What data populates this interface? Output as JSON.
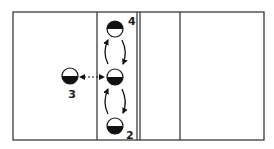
{
  "diagram": {
    "type": "volleyball-court-rotation",
    "colors": {
      "line": "#2a2a2a",
      "fill": "#111111",
      "background": "#ffffff"
    },
    "court": {
      "x": 13,
      "y": 12,
      "width": 251,
      "height": 128,
      "vertical_lines": [
        97,
        137,
        140,
        180
      ]
    },
    "players": [
      {
        "id": "center",
        "label": "",
        "cx": 115,
        "cy": 77,
        "r": 8,
        "filled_half": "bottom"
      },
      {
        "id": "p4",
        "label": "4",
        "cx": 115,
        "cy": 29,
        "r": 8,
        "filled_half": "top",
        "label_x": 131,
        "label_y": 24
      },
      {
        "id": "p3",
        "label": "3",
        "cx": 70,
        "cy": 76,
        "r": 8,
        "filled_half": "bottom",
        "label_x": 71,
        "label_y": 96
      },
      {
        "id": "p2",
        "label": "2",
        "cx": 115,
        "cy": 126,
        "r": 8,
        "filled_half": "bottom",
        "label_x": 129,
        "label_y": 139
      }
    ],
    "arrows": [
      {
        "id": "center-to-4",
        "direction": "up",
        "side": "left"
      },
      {
        "id": "4-to-center",
        "direction": "down",
        "side": "right"
      },
      {
        "id": "2-to-center",
        "direction": "up",
        "side": "left"
      },
      {
        "id": "center-to-2",
        "direction": "down",
        "side": "right"
      },
      {
        "id": "3-center-exchange",
        "style": "dashed",
        "heads": "both"
      }
    ],
    "labels": {
      "p4": "4",
      "p3": "3",
      "p2": "2"
    }
  }
}
